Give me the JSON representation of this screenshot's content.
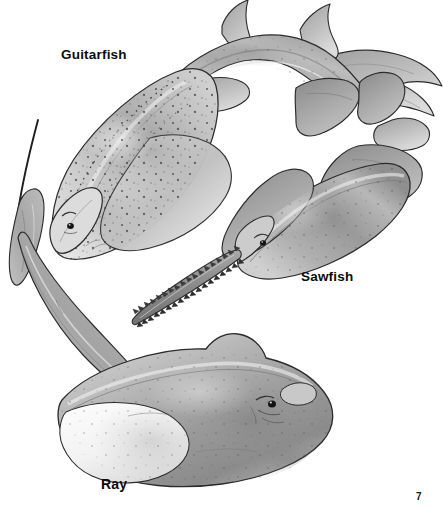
{
  "page": {
    "number": "7",
    "background_color": "#ffffff",
    "width": 444,
    "height": 507,
    "medium": "grayscale pencil and airbrush scientific illustration"
  },
  "labels": {
    "guitarfish": "Guitarfish",
    "sawfish": "Sawfish",
    "ray": "Ray"
  },
  "figures": [
    {
      "name": "guitarfish",
      "label": "Guitarfish",
      "description": "Guitarfish seen from above, curving from lower-left head to upper-right tail, with broad triangular pectoral disc, two dorsal fins and a shark-like caudal fin.",
      "label_position": {
        "x": 61,
        "y": 48
      }
    },
    {
      "name": "sawfish",
      "label": "Sawfish",
      "description": "Sawfish seen from above with a long toothed rostrum (saw) extending to lower-left, broad pectoral fins, two dorsal fins and caudal fin to the upper right.",
      "label_position": {
        "x": 301,
        "y": 270
      }
    },
    {
      "name": "ray",
      "label": "Ray",
      "description": "Ray seen from above with a broad diamond-shaped disc, pale underside edge visible, and a long slender whip-like tail sweeping up to the left.",
      "label_position": {
        "x": 101,
        "y": 477
      }
    }
  ],
  "palette": {
    "ink": "#1a1a1a",
    "outline": "#2b2b2b",
    "body_light": "#e2e2e2",
    "body_mid": "#b4b4b4",
    "body_dark": "#8a8a8a",
    "body_shadow": "#6a6a6a",
    "highlight": "#f4f4f4",
    "background": "#ffffff"
  }
}
